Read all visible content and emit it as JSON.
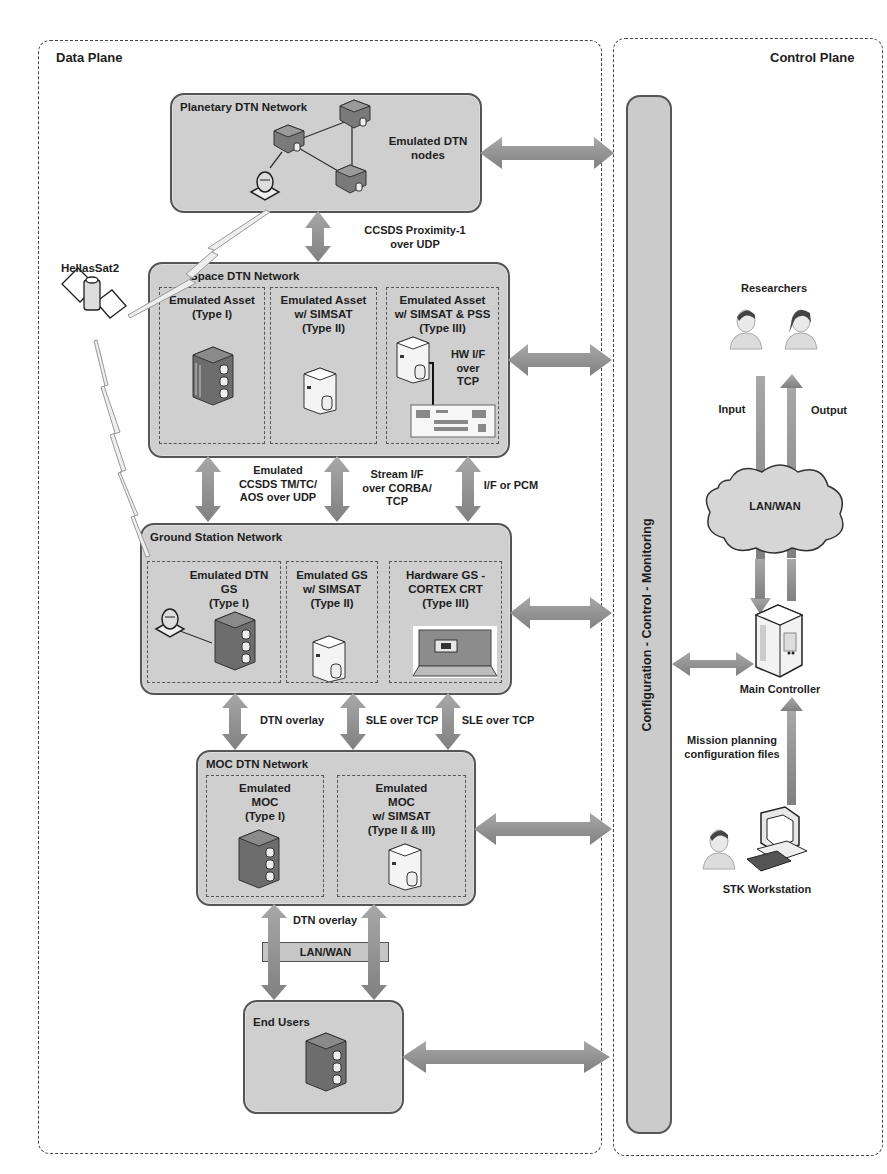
{
  "planes": {
    "data_plane": {
      "title": "Data Plane"
    },
    "control_plane": {
      "title": "Control Plane"
    }
  },
  "networks": {
    "planetary": {
      "title": "Planetary DTN Network",
      "label": "Emulated DTN nodes",
      "label_lines": [
        "Emulated DTN",
        "nodes"
      ]
    },
    "space": {
      "title": "Space DTN Network",
      "assets": [
        {
          "lines": [
            "Emulated Asset",
            "(Type I)"
          ]
        },
        {
          "lines": [
            "Emulated Asset",
            "w/ SIMSAT",
            "(Type II)"
          ]
        },
        {
          "lines": [
            "Emulated Asset",
            "w/ SIMSAT & PSS",
            "(Type III)"
          ]
        }
      ],
      "hw_label_lines": [
        "HW I/F over",
        "TCP"
      ]
    },
    "ground": {
      "title": "Ground Station Network",
      "assets": [
        {
          "lines": [
            "Emulated DTN",
            "GS",
            "(Type I)"
          ]
        },
        {
          "lines": [
            "Emulated GS",
            "w/ SIMSAT",
            "(Type II)"
          ]
        },
        {
          "lines": [
            "Hardware GS -",
            "CORTEX CRT",
            "(Type III)"
          ]
        }
      ]
    },
    "moc": {
      "title": "MOC DTN Network",
      "assets": [
        {
          "lines": [
            "Emulated",
            "MOC",
            "(Type I)"
          ]
        },
        {
          "lines": [
            "Emulated",
            "MOC",
            "w/ SIMSAT",
            "(Type II & III)"
          ]
        }
      ]
    },
    "end_users": {
      "title": "End Users"
    }
  },
  "links": {
    "planetary_space": [
      "CCSDS Proximity-1",
      "over UDP"
    ],
    "space_ground_1": [
      "Emulated",
      "CCSDS TM/TC/",
      "AOS over UDP"
    ],
    "space_ground_2": [
      "Stream I/F",
      "over CORBA/",
      "TCP"
    ],
    "space_ground_3": [
      "I/F or PCM"
    ],
    "ground_moc_1": [
      "DTN overlay"
    ],
    "ground_moc_2": [
      "SLE over TCP"
    ],
    "ground_moc_3": [
      "SLE over TCP"
    ],
    "moc_users": [
      "DTN overlay"
    ],
    "lan_wan_bar": "LAN/WAN"
  },
  "satellite": {
    "name": "HellasSat2"
  },
  "control": {
    "bar_label": "Configuration - Control - Monitoring",
    "researchers": "Researchers",
    "input": "Input",
    "output": "Output",
    "cloud": "LAN/WAN",
    "main_controller": "Main Controller",
    "mission_files": [
      "Mission planning",
      "configuration files"
    ],
    "stk": "STK Workstation"
  },
  "colors": {
    "box_fill": "#cfcfcf",
    "box_border": "#555555",
    "arrow": "#8f8f8f",
    "text": "#1e1e1e"
  }
}
